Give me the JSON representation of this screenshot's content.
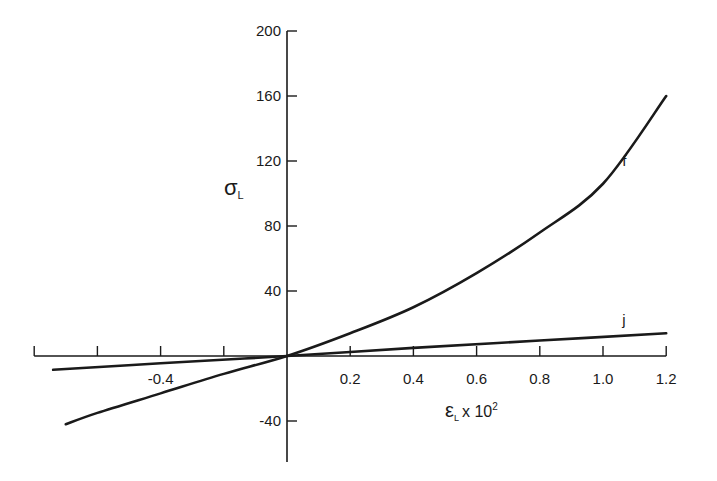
{
  "chart_data": {
    "type": "line",
    "title": "",
    "xlabel": "εL x 10^2",
    "xlabel_parts": {
      "symbol": "ε",
      "sub": "L",
      "mult": "x 10",
      "sup": "2"
    },
    "ylabel": "σL",
    "ylabel_parts": {
      "symbol": "σ",
      "sub": "L"
    },
    "xlim": [
      -0.8,
      1.2
    ],
    "ylim": [
      -60,
      200
    ],
    "x_ticks": [
      -0.8,
      -0.6,
      -0.4,
      -0.2,
      0.2,
      0.4,
      0.6,
      0.8,
      1.0,
      1.2
    ],
    "x_tick_labels": [
      {
        "value": -0.4,
        "text": "-0.4"
      },
      {
        "value": 0.2,
        "text": "0.2"
      },
      {
        "value": 0.4,
        "text": "0.4"
      },
      {
        "value": 0.6,
        "text": "0.6"
      },
      {
        "value": 0.8,
        "text": "0.8"
      },
      {
        "value": 1.0,
        "text": "1.0"
      },
      {
        "value": 1.2,
        "text": "1.2"
      }
    ],
    "y_ticks": [
      200,
      160,
      120,
      80,
      40,
      -40
    ],
    "y_tick_labels": [
      {
        "value": 200,
        "text": "200"
      },
      {
        "value": 160,
        "text": "160"
      },
      {
        "value": 120,
        "text": "120"
      },
      {
        "value": 80,
        "text": "80"
      },
      {
        "value": 40,
        "text": "40"
      },
      {
        "value": -40,
        "text": "-40"
      }
    ],
    "grid": false,
    "legend": "none (curves labeled inline)",
    "series": [
      {
        "name": "f",
        "x": [
          -0.7,
          -0.6,
          -0.4,
          -0.2,
          0.0,
          0.2,
          0.4,
          0.6,
          0.8,
          1.0,
          1.2
        ],
        "y": [
          -42,
          -35,
          -23,
          -11,
          0,
          14,
          30,
          51,
          76,
          106,
          160
        ],
        "label_pos": {
          "x": 1.08,
          "y": 120
        }
      },
      {
        "name": "j",
        "x": [
          -0.74,
          -0.4,
          0.0,
          0.4,
          0.8,
          1.2
        ],
        "y": [
          -8.5,
          -4.5,
          0,
          5,
          9.5,
          14
        ],
        "label_pos": {
          "x": 1.08,
          "y": 22
        }
      }
    ]
  }
}
